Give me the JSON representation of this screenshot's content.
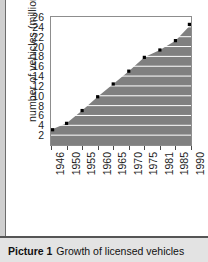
{
  "caption": {
    "label": "Picture 1",
    "text": "Growth of licensed vehicles"
  },
  "colors": {
    "area_fill": "#808080",
    "gridline": "#ffffff",
    "marker": "#000000",
    "frame": "#8d8d8d",
    "caption_band": "#e3e3e3",
    "page": "#ffffff"
  },
  "chart_data": {
    "type": "area",
    "title": "",
    "subtitle": "",
    "xlabel": "",
    "ylabel": "number of vehicles (millions)",
    "categories": [
      "1946",
      "1950",
      "1955",
      "1960",
      "1965",
      "1970",
      "1975",
      "1981",
      "1985",
      "1990"
    ],
    "x": [
      1946,
      1950,
      1955,
      1960,
      1965,
      1970,
      1975,
      1981,
      1985,
      1990
    ],
    "values": [
      3.1,
      4.4,
      7.0,
      9.8,
      12.4,
      15.0,
      17.8,
      19.3,
      21.2,
      24.5
    ],
    "series": [
      {
        "name": "licensed vehicles",
        "values": [
          3.1,
          4.4,
          7.0,
          9.8,
          12.4,
          15.0,
          17.8,
          19.3,
          21.2,
          24.5
        ]
      }
    ],
    "yticks": [
      2,
      4,
      6,
      8,
      10,
      12,
      14,
      16,
      18,
      20,
      22,
      24,
      26
    ],
    "ytick_labels": [
      "2",
      "4",
      "6",
      "8",
      "10",
      "12",
      "14",
      "16",
      "18",
      "20",
      "22",
      "24",
      "26"
    ],
    "xtick_labels": [
      "1946",
      "1950",
      "1955",
      "1960",
      "1965",
      "1970",
      "1975",
      "1981",
      "1985",
      "1990"
    ],
    "ylim": [
      0,
      26
    ],
    "xlim": [
      1946,
      1990
    ],
    "grid": true,
    "grid_axis": "y",
    "legend": false,
    "legend_position": "none",
    "markers": true,
    "annotations": []
  }
}
